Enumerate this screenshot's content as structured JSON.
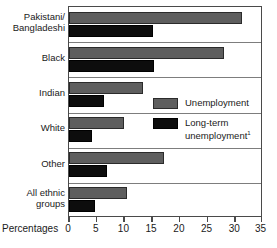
{
  "chart_data": {
    "type": "bar",
    "orientation": "horizontal",
    "title": "",
    "xlabel": "Percentages",
    "ylabel": "",
    "xlim": [
      0,
      35
    ],
    "xticks": [
      0,
      5,
      10,
      15,
      20,
      25,
      30,
      35
    ],
    "grid": false,
    "legend_position": "middle-right",
    "categories": [
      "Pakistani/\nBangladeshi",
      "Black",
      "Indian",
      "White",
      "Other",
      "All ethnic\ngroups"
    ],
    "series": [
      {
        "name": "Unemployment",
        "color": "#5e5e5e",
        "values": [
          31.5,
          28.3,
          13.4,
          10.0,
          17.3,
          10.6
        ]
      },
      {
        "name": "Long-term unemployment",
        "color": "#0d0d0d",
        "values": [
          15.4,
          15.5,
          6.4,
          4.2,
          6.9,
          4.8
        ]
      }
    ],
    "footnote_marker": "1"
  },
  "categories": [
    {
      "line1": "Pakistani/",
      "line2": "Bangladeshi"
    },
    {
      "line1": "Black",
      "line2": ""
    },
    {
      "line1": "Indian",
      "line2": ""
    },
    {
      "line1": "White",
      "line2": ""
    },
    {
      "line1": "Other",
      "line2": ""
    },
    {
      "line1": "All ethnic",
      "line2": "groups"
    }
  ],
  "axis": {
    "title": "Percentages",
    "ticks": [
      "0",
      "5",
      "10",
      "15",
      "20",
      "25",
      "30",
      "35"
    ]
  },
  "legend": {
    "items": [
      {
        "label": "Unemployment",
        "sup": ""
      },
      {
        "label": "Long-term",
        "label2": "unemployment",
        "sup": "1"
      }
    ]
  }
}
